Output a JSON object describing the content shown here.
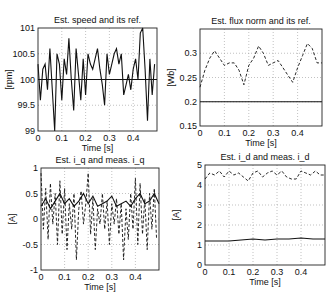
{
  "chart_data": [
    {
      "type": "line",
      "title": "Est. speed and its ref.",
      "xlabel": "Time [s]",
      "ylabel": "[rpm]",
      "xlim": [
        0,
        0.5
      ],
      "ylim": [
        99,
        101
      ],
      "xticks": [
        "0",
        "0.1",
        "0.2",
        "0.3",
        "0.4"
      ],
      "yticks": [
        "99",
        "99.5",
        "100",
        "100.5",
        "101"
      ],
      "grid": true,
      "box": {
        "x": 38,
        "y": 28,
        "w": 119,
        "h": 103
      },
      "series": [
        {
          "name": "Est. speed",
          "style": "solid",
          "x": [
            0,
            0.01,
            0.02,
            0.03,
            0.04,
            0.05,
            0.06,
            0.07,
            0.08,
            0.09,
            0.1,
            0.11,
            0.12,
            0.13,
            0.14,
            0.15,
            0.16,
            0.17,
            0.18,
            0.19,
            0.2,
            0.21,
            0.22,
            0.23,
            0.24,
            0.25,
            0.26,
            0.27,
            0.28,
            0.29,
            0.3,
            0.31,
            0.32,
            0.33,
            0.34,
            0.35,
            0.36,
            0.37,
            0.38,
            0.39,
            0.4,
            0.41,
            0.42,
            0.43,
            0.44,
            0.45,
            0.46,
            0.47,
            0.48,
            0.49
          ],
          "values": [
            100.3,
            99.6,
            100.2,
            100.3,
            99.8,
            100.6,
            99.8,
            99.0,
            100.5,
            100.3,
            99.6,
            100.4,
            100.1,
            100.8,
            100.0,
            99.4,
            100.6,
            100.1,
            99.6,
            100.4,
            99.7,
            100.5,
            100.3,
            100.2,
            100.4,
            100.6,
            100.2,
            99.9,
            99.5,
            100.5,
            100.1,
            100.3,
            100.5,
            100.6,
            100.3,
            100.5,
            99.7,
            99.9,
            100.1,
            99.8,
            100.2,
            100.4,
            100.0,
            100.9,
            101.0,
            100.2,
            99.2,
            100.4,
            99.7,
            100.3
          ]
        },
        {
          "name": "Speed ref.",
          "style": "solid",
          "x": [
            0,
            0.5
          ],
          "values": [
            100,
            100
          ]
        }
      ]
    },
    {
      "type": "line",
      "title": "Est. flux norm and its ref.",
      "xlabel": "Time [s]",
      "ylabel": "[Wb]",
      "xlim": [
        0,
        0.5
      ],
      "ylim": [
        0.15,
        0.35
      ],
      "xticks": [
        "0",
        "0.1",
        "0.2",
        "0.3",
        "0.4"
      ],
      "yticks": [
        "0.15",
        "0.2",
        "0.25",
        "0.3"
      ],
      "grid": true,
      "box": {
        "x": 200,
        "y": 29,
        "w": 122,
        "h": 97
      },
      "series": [
        {
          "name": "Est. flux norm",
          "style": "dashed",
          "x": [
            0,
            0.02,
            0.04,
            0.06,
            0.08,
            0.1,
            0.12,
            0.14,
            0.16,
            0.18,
            0.2,
            0.22,
            0.24,
            0.26,
            0.28,
            0.3,
            0.32,
            0.34,
            0.36,
            0.38,
            0.4,
            0.42,
            0.44,
            0.46,
            0.48,
            0.5
          ],
          "values": [
            0.23,
            0.265,
            0.29,
            0.305,
            0.29,
            0.275,
            0.28,
            0.28,
            0.265,
            0.235,
            0.275,
            0.29,
            0.315,
            0.3,
            0.275,
            0.28,
            0.285,
            0.27,
            0.255,
            0.24,
            0.27,
            0.295,
            0.32,
            0.31,
            0.28,
            0.28
          ]
        },
        {
          "name": "Flux ref.",
          "style": "solid",
          "x": [
            0,
            0.5
          ],
          "values": [
            0.2,
            0.2
          ]
        }
      ]
    },
    {
      "type": "line",
      "title": "Est. i_q and meas. i_q",
      "xlabel": "Time [s]",
      "ylabel": "[A]",
      "xlim": [
        0,
        0.5
      ],
      "ylim": [
        -1,
        1
      ],
      "xticks": [
        "0",
        "0.1",
        "0.2",
        "0.3",
        "0.4"
      ],
      "yticks": [
        "-1",
        "-0.5",
        "0",
        "0.5",
        "1"
      ],
      "grid": true,
      "box": {
        "x": 41,
        "y": 168,
        "w": 118,
        "h": 102
      },
      "series": [
        {
          "name": "Est. i_q",
          "style": "solid",
          "x": [
            0,
            0.02,
            0.04,
            0.06,
            0.08,
            0.1,
            0.12,
            0.14,
            0.16,
            0.18,
            0.2,
            0.22,
            0.24,
            0.26,
            0.28,
            0.3,
            0.32,
            0.34,
            0.36,
            0.38,
            0.4,
            0.42,
            0.44,
            0.46,
            0.48,
            0.5
          ],
          "values": [
            0.25,
            0.4,
            0.2,
            0.35,
            0.5,
            0.3,
            0.4,
            0.25,
            0.35,
            0.5,
            0.3,
            0.45,
            0.25,
            0.3,
            0.35,
            0.45,
            0.25,
            0.3,
            0.35,
            0.25,
            0.4,
            0.5,
            0.3,
            0.35,
            0.5,
            0.3
          ]
        },
        {
          "name": "Meas. i_q",
          "style": "dashed",
          "x": [
            0,
            0.01,
            0.02,
            0.03,
            0.04,
            0.05,
            0.06,
            0.07,
            0.08,
            0.09,
            0.1,
            0.11,
            0.12,
            0.13,
            0.14,
            0.15,
            0.16,
            0.17,
            0.18,
            0.19,
            0.2,
            0.21,
            0.22,
            0.23,
            0.24,
            0.25,
            0.26,
            0.27,
            0.28,
            0.29,
            0.3,
            0.31,
            0.32,
            0.33,
            0.34,
            0.35,
            0.36,
            0.37,
            0.38,
            0.39,
            0.4,
            0.41,
            0.42,
            0.43,
            0.44,
            0.45,
            0.46,
            0.47,
            0.48,
            0.49
          ],
          "values": [
            0.9,
            -0.2,
            0.6,
            -0.4,
            0.7,
            -0.1,
            0.5,
            -0.5,
            0.75,
            -0.3,
            0.6,
            -0.6,
            0.3,
            -0.2,
            0.5,
            -0.8,
            0.2,
            0.55,
            -0.1,
            0.3,
            0.9,
            -0.3,
            0.4,
            -0.6,
            0.2,
            -0.1,
            0.5,
            -0.2,
            0.35,
            -0.5,
            0.3,
            -0.1,
            0.4,
            -0.3,
            0.3,
            -0.8,
            0.2,
            -0.4,
            0.5,
            -0.2,
            0.8,
            -0.5,
            0.7,
            -0.3,
            0.4,
            -0.6,
            0.5,
            -0.2,
            0.6,
            -0.4
          ]
        }
      ]
    },
    {
      "type": "line",
      "title": "Est. i_d and meas. i_d",
      "xlabel": "Time [s]",
      "ylabel": "[A]",
      "xlim": [
        0,
        0.5
      ],
      "ylim": [
        0,
        5
      ],
      "xticks": [
        "0",
        "0.1",
        "0.2",
        "0.3",
        "0.4"
      ],
      "yticks": [
        "0",
        "1",
        "2",
        "3",
        "4",
        "5"
      ],
      "grid": true,
      "box": {
        "x": 205,
        "y": 165,
        "w": 120,
        "h": 100
      },
      "series": [
        {
          "name": "Meas. i_d",
          "style": "dashed",
          "x": [
            0,
            0.02,
            0.04,
            0.06,
            0.08,
            0.1,
            0.12,
            0.14,
            0.16,
            0.18,
            0.2,
            0.22,
            0.24,
            0.26,
            0.28,
            0.3,
            0.32,
            0.34,
            0.36,
            0.38,
            0.4,
            0.42,
            0.44,
            0.46,
            0.48,
            0.5
          ],
          "values": [
            4.3,
            4.6,
            4.5,
            4.7,
            4.4,
            4.7,
            4.5,
            4.6,
            4.4,
            4.2,
            4.6,
            4.7,
            4.4,
            4.6,
            4.7,
            4.5,
            4.7,
            4.4,
            4.3,
            4.3,
            4.7,
            4.6,
            4.5,
            4.7,
            4.5,
            4.5
          ]
        },
        {
          "name": "Est. i_d",
          "style": "solid",
          "x": [
            0,
            0.05,
            0.1,
            0.15,
            0.2,
            0.25,
            0.3,
            0.35,
            0.4,
            0.45,
            0.5
          ],
          "values": [
            1.2,
            1.2,
            1.2,
            1.25,
            1.3,
            1.25,
            1.3,
            1.3,
            1.35,
            1.3,
            1.3
          ]
        }
      ]
    }
  ]
}
